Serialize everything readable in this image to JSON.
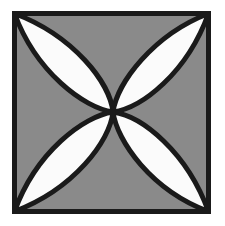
{
  "figure": {
    "title": "Quatrefoil four-petal rosette tile",
    "canvas": {
      "width": 225,
      "height": 226,
      "background_color": "#ffffff"
    },
    "colors": {
      "outline": "#1a1a1a",
      "tile_fill": "#8a8a8a",
      "petal_fill": "#fbfbfb",
      "page_background": "#ffffff"
    },
    "square": {
      "label": "Outer square border",
      "left": 14,
      "top": 13,
      "right": 209,
      "bottom": 212,
      "width": 195,
      "height": 199,
      "stroke_width": 5
    },
    "center_point": {
      "label": "Petal convergence point",
      "x": 113,
      "y": 112
    },
    "petal_stroke_width": 5,
    "petal_count": 4,
    "petals": [
      {
        "name": "top-left-petal",
        "label": "Top-left petal",
        "direction": "northwest",
        "tip_x": 14,
        "tip_y": 13,
        "fill": "#fbfbfb"
      },
      {
        "name": "top-right-petal",
        "label": "Top-right petal",
        "direction": "northeast",
        "tip_x": 209,
        "tip_y": 13,
        "fill": "#fbfbfb"
      },
      {
        "name": "bottom-right-petal",
        "label": "Bottom-right petal",
        "direction": "southeast",
        "tip_x": 209,
        "tip_y": 212,
        "fill": "#fbfbfb"
      },
      {
        "name": "bottom-left-petal",
        "label": "Bottom-left petal",
        "direction": "southwest",
        "tip_x": 14,
        "tip_y": 212,
        "fill": "#fbfbfb"
      }
    ],
    "paths": {
      "square_rect": "M14.5,13.5 L208.5,13.5 L208.5,211.5 L14.5,211.5 Z",
      "petal_tl": "M113,112 C84,108 36,72 14.5,13.5 C74,36 110,83 113,112 Z",
      "petal_tr": "M113,112 C117,83 153,35 208.5,13.5 C187,73 142,108 113,112 Z",
      "petal_br": "M113,112 C142,116 187,152 208.5,211.5 C151,190 117,141 113,112 Z",
      "petal_bl": "M113,112 C110,141 74,189 14.5,211.5 C36,152 84,116 113,112 Z"
    }
  }
}
